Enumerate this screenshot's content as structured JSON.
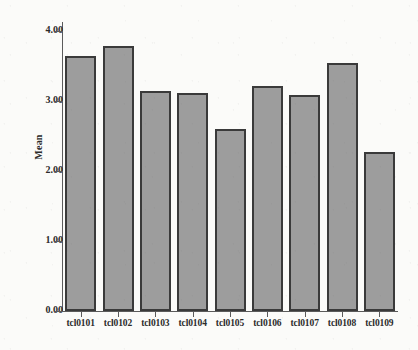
{
  "chart_data": {
    "type": "bar",
    "title": "",
    "subtitle": "",
    "xlabel": "",
    "ylabel": "Mean",
    "categories": [
      "tcl0101",
      "tcl0102",
      "tcl0103",
      "tcl0104",
      "tcl0105",
      "tcl0106",
      "tcl0107",
      "tcl0108",
      "tcl0109"
    ],
    "values": [
      3.64,
      3.78,
      3.14,
      3.12,
      2.6,
      3.22,
      3.08,
      3.54,
      2.27
    ],
    "ylim": [
      0.0,
      4.0
    ],
    "ytick_labels": [
      "0.00",
      "1.00",
      "2.00",
      "3.00",
      "4.00"
    ],
    "ytick_values": [
      0.0,
      1.0,
      2.0,
      3.0,
      4.0
    ],
    "grid": false,
    "legend": null,
    "bar_color": "#9d9d9d",
    "bar_edge_color": "#3a3a3a",
    "axis_color": "#5b5b5b",
    "background_color": "#fbfbf9",
    "text_color": "#2b2b2b"
  }
}
